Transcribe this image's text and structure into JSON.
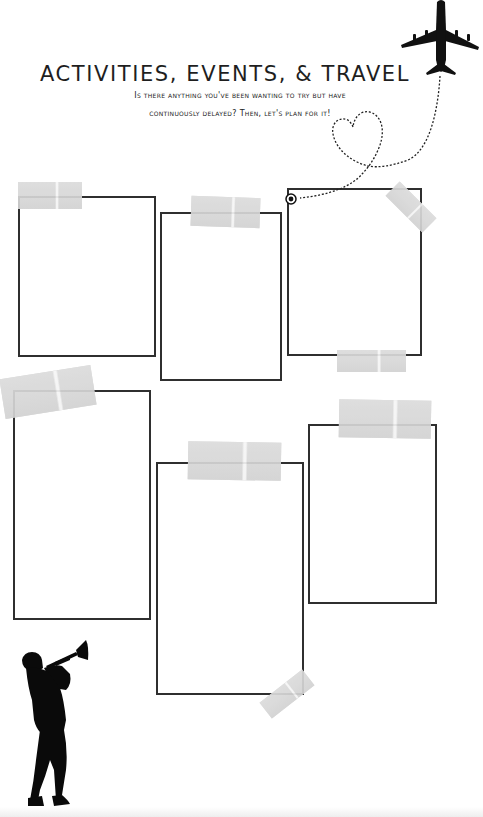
{
  "page": {
    "title": "ACTIVITIES, EVENTS, & TRAVEL",
    "subtitle_line1": "Is there anything you've been wanting to try but have",
    "subtitle_line2": "continuously delayed? Then, let's plan for it!"
  },
  "frames": [
    {
      "id": "frame-1",
      "x": 18,
      "y": 196,
      "w": 138,
      "h": 161
    },
    {
      "id": "frame-2",
      "x": 160,
      "y": 212,
      "w": 122,
      "h": 169
    },
    {
      "id": "frame-3",
      "x": 287,
      "y": 188,
      "w": 135,
      "h": 168
    },
    {
      "id": "frame-4",
      "x": 13,
      "y": 390,
      "w": 138,
      "h": 230
    },
    {
      "id": "frame-5",
      "x": 156,
      "y": 462,
      "w": 148,
      "h": 233
    },
    {
      "id": "frame-6",
      "x": 308,
      "y": 424,
      "w": 129,
      "h": 180
    }
  ],
  "icons": {
    "airplane": "airplane-icon",
    "heart_path": "dotted-heart-path",
    "pin": "pin-circle-icon",
    "musician": "trumpet-player-silhouette"
  },
  "colors": {
    "line": "#2f2f2f",
    "tape": "#d9d9d9",
    "text": "#1e1e1e",
    "background": "#ffffff"
  }
}
